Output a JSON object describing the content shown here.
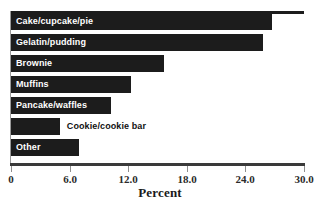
{
  "chart_data": {
    "type": "bar",
    "orientation": "horizontal",
    "title": "",
    "subtitle": "",
    "xlabel": "Percent",
    "ylabel": "",
    "xlim": [
      0,
      30
    ],
    "xticks": [
      "0",
      "6.0",
      "12.0",
      "18.0",
      "24.0",
      "30.0"
    ],
    "xtick_values": [
      0,
      6,
      12,
      18,
      24,
      30
    ],
    "grid": false,
    "legend": null,
    "categories": [
      "Cake/cupcake/pie",
      "Gelatin/pudding",
      "Brownie",
      "Muffins",
      "Pancake/waffles",
      "Cookie/cookie bar",
      "Other"
    ],
    "values": [
      26.7,
      25.8,
      15.7,
      12.3,
      10.2,
      5.0,
      7.0
    ],
    "label_placement": [
      "inside",
      "inside",
      "inside",
      "inside",
      "inside",
      "outside",
      "inside"
    ],
    "bar_color": "#1c1c1c",
    "inside_label_color": "#ffffff",
    "outside_label_color": "#111111",
    "background_color": "#ffffff",
    "axis_color": "#3a3a3a"
  }
}
